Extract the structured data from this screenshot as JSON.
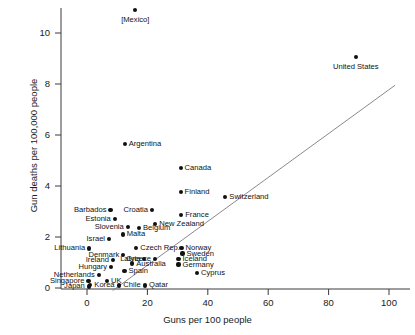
{
  "chart_data": {
    "type": "scatter",
    "title": "",
    "xlabel": "Guns per 100 people",
    "ylabel": "Gun deaths per 100,000 people",
    "xlim": [
      -4,
      108
    ],
    "ylim": [
      -0.45,
      11.4
    ],
    "xticks": [
      0,
      20,
      40,
      60,
      80,
      100
    ],
    "yticks": [
      0,
      2,
      4,
      6,
      8,
      10
    ],
    "grid": false,
    "legend": null,
    "trendline": {
      "x0": 8.5,
      "y0": -0.1,
      "x1": 102,
      "y1": 7.95
    },
    "points": [
      {
        "label": "[Mexico]",
        "x": 16.0,
        "y": 10.9,
        "pos": "below"
      },
      {
        "label": "United States",
        "x": 89.0,
        "y": 9.05,
        "pos": "below"
      },
      {
        "label": "Argentina",
        "x": 12.5,
        "y": 5.65,
        "pos": "right"
      },
      {
        "label": "Canada",
        "x": 31.0,
        "y": 4.7,
        "pos": "right"
      },
      {
        "label": "Finland",
        "x": 31.0,
        "y": 3.75,
        "pos": "right"
      },
      {
        "label": "Switzerland",
        "x": 45.8,
        "y": 3.58,
        "pos": "right"
      },
      {
        "label": "Barbados",
        "x": 7.8,
        "y": 3.06,
        "pos": "left"
      },
      {
        "label": "Croatia",
        "x": 21.5,
        "y": 3.06,
        "pos": "left"
      },
      {
        "label": "France",
        "x": 31.2,
        "y": 2.85,
        "pos": "right"
      },
      {
        "label": "Estonia",
        "x": 9.2,
        "y": 2.7,
        "pos": "left"
      },
      {
        "label": "New Zealand",
        "x": 22.6,
        "y": 2.52,
        "pos": "right"
      },
      {
        "label": "Slovenia",
        "x": 13.5,
        "y": 2.38,
        "pos": "left"
      },
      {
        "label": "Belgium",
        "x": 17.2,
        "y": 2.36,
        "pos": "right"
      },
      {
        "label": "Malta",
        "x": 11.8,
        "y": 2.1,
        "pos": "right"
      },
      {
        "label": "Israel",
        "x": 7.3,
        "y": 1.92,
        "pos": "left"
      },
      {
        "label": "Czech Rep.",
        "x": 16.3,
        "y": 1.58,
        "pos": "right"
      },
      {
        "label": "Norway",
        "x": 31.3,
        "y": 1.58,
        "pos": "right"
      },
      {
        "label": "Lithuania",
        "x": 0.7,
        "y": 1.55,
        "pos": "left"
      },
      {
        "label": "Sweden",
        "x": 31.6,
        "y": 1.35,
        "pos": "right"
      },
      {
        "label": "Denmark",
        "x": 12.0,
        "y": 1.3,
        "pos": "left"
      },
      {
        "label": "Latvia",
        "x": 19.0,
        "y": 1.13,
        "pos": "left"
      },
      {
        "label": "Greece",
        "x": 22.5,
        "y": 1.13,
        "pos": "left"
      },
      {
        "label": "Iceland",
        "x": 30.3,
        "y": 1.13,
        "pos": "right"
      },
      {
        "label": "Ireland",
        "x": 8.6,
        "y": 1.1,
        "pos": "left"
      },
      {
        "label": "Australia",
        "x": 15.0,
        "y": 0.96,
        "pos": "right"
      },
      {
        "label": "Germany",
        "x": 30.3,
        "y": 0.92,
        "pos": "right"
      },
      {
        "label": "Hungary",
        "x": 8.0,
        "y": 0.83,
        "pos": "left"
      },
      {
        "label": "Spain",
        "x": 12.4,
        "y": 0.67,
        "pos": "right"
      },
      {
        "label": "Cyprus",
        "x": 36.4,
        "y": 0.6,
        "pos": "right"
      },
      {
        "label": "Netherlands",
        "x": 3.9,
        "y": 0.5,
        "pos": "left"
      },
      {
        "label": "Singapore",
        "x": 0.5,
        "y": 0.26,
        "pos": "left"
      },
      {
        "label": "UK",
        "x": 6.6,
        "y": 0.26,
        "pos": "right"
      },
      {
        "label": "Japan",
        "x": 0.6,
        "y": 0.06,
        "pos": "left"
      },
      {
        "label": "Korea",
        "x": 1.1,
        "y": 0.12,
        "pos": "right"
      },
      {
        "label": "Chile",
        "x": 10.7,
        "y": 0.1,
        "pos": "right"
      },
      {
        "label": "Qatar",
        "x": 19.2,
        "y": 0.1,
        "pos": "right"
      }
    ]
  },
  "axes": {
    "xtick_labels": [
      "0",
      "20",
      "40",
      "60",
      "80",
      "100"
    ],
    "ytick_labels": [
      "0",
      "2",
      "4",
      "6",
      "8",
      "10"
    ],
    "x_title": "Guns per 100 people",
    "y_title": "Gun deaths per 100,000 people"
  }
}
